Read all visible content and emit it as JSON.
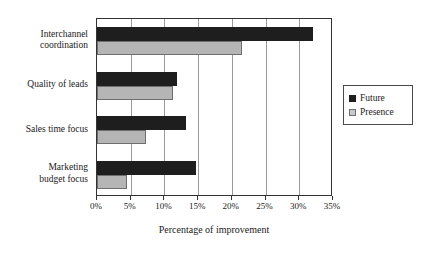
{
  "chart_data": {
    "type": "bar",
    "orientation": "horizontal",
    "title": "",
    "xlabel": "Percentage of improvement",
    "ylabel": "",
    "categories": [
      "Interchannel\ncoordination",
      "Quality of leads",
      "Sales time focus",
      "Marketing\nbudget focus"
    ],
    "series": [
      {
        "name": "Future",
        "color": "#1e1e1e",
        "values": [
          32.0,
          11.8,
          13.2,
          14.7
        ]
      },
      {
        "name": "Presence",
        "color": "#b5b5b5",
        "values": [
          21.5,
          11.3,
          7.3,
          4.4
        ]
      }
    ],
    "xlim": [
      0,
      35
    ],
    "xticks": [
      0,
      5,
      10,
      15,
      20,
      25,
      30,
      35
    ],
    "xtick_labels": [
      "0%",
      "5%",
      "10%",
      "15%",
      "20%",
      "25%",
      "30%",
      "35%"
    ],
    "grid": "vertical",
    "legend_position": "right"
  },
  "legend": {
    "entries": [
      {
        "label": "Future"
      },
      {
        "label": "Presence"
      }
    ]
  },
  "axis": {
    "x_title": "Percentage of improvement"
  }
}
